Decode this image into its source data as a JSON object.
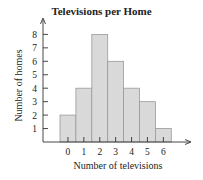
{
  "chart_data": {
    "type": "bar",
    "title": "Televisions per Home",
    "xlabel": "Number of televisions",
    "ylabel": "Number of homes",
    "categories": [
      "0",
      "1",
      "2",
      "3",
      "4",
      "5",
      "6"
    ],
    "values": [
      2,
      4,
      8,
      6,
      4,
      3,
      1
    ],
    "yticks": [
      "1",
      "2",
      "3",
      "4",
      "5",
      "6",
      "7",
      "8"
    ],
    "ylim": [
      0,
      8
    ],
    "grid": false,
    "bar_color": "#d9d9d9",
    "bar_edge": "#9a9a9a"
  }
}
